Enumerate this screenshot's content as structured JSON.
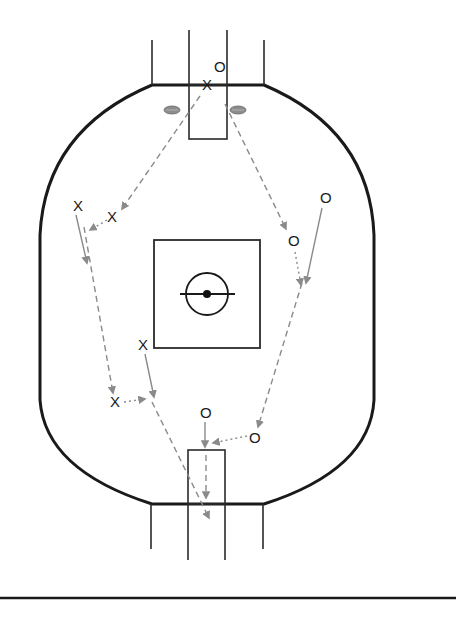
{
  "diagram": {
    "colors": {
      "boundary": "#1a1a1a",
      "markings": "#2a2a2a",
      "path": "#8a8a8a",
      "ball": "#8c8c8c",
      "background": "#ffffff"
    },
    "players": [
      {
        "id": "x1",
        "label": "X",
        "team": "X",
        "x": 207,
        "y": 84
      },
      {
        "id": "o1",
        "label": "O",
        "team": "O",
        "x": 219,
        "y": 66
      },
      {
        "id": "x2",
        "label": "X",
        "team": "X",
        "x": 78,
        "y": 206
      },
      {
        "id": "x3",
        "label": "X",
        "team": "X",
        "x": 112,
        "y": 217
      },
      {
        "id": "o2",
        "label": "O",
        "team": "O",
        "x": 325,
        "y": 198
      },
      {
        "id": "o3",
        "label": "O",
        "team": "O",
        "x": 293,
        "y": 241
      },
      {
        "id": "x4",
        "label": "X",
        "team": "X",
        "x": 143,
        "y": 345
      },
      {
        "id": "x5",
        "label": "X",
        "team": "X",
        "x": 115,
        "y": 402
      },
      {
        "id": "o4",
        "label": "O",
        "team": "O",
        "x": 205,
        "y": 413
      },
      {
        "id": "o5",
        "label": "O",
        "team": "O",
        "x": 254,
        "y": 438
      }
    ],
    "balls": [
      {
        "id": "ball-left",
        "x": 172,
        "y": 110
      },
      {
        "id": "ball-right",
        "x": 238,
        "y": 110
      }
    ],
    "legend_note": "X vs O player movements; solid = player run, dashed = kick, dotted = handball"
  }
}
